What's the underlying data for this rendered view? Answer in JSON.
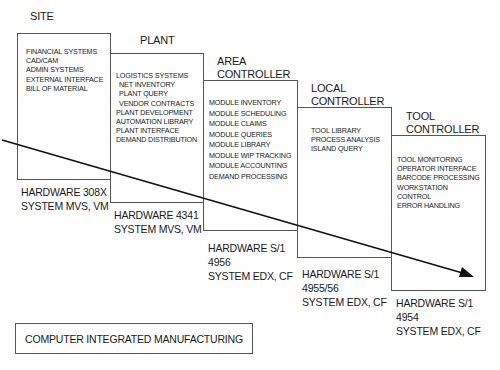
{
  "diagram": {
    "levels": [
      {
        "title": [
          "SITE"
        ],
        "items": [
          "FINANCIAL SYSTEMS",
          "CAD/CAM",
          "ADMIN SYSTEMS",
          "EXTERNAL INTERFACE",
          "BILL OF MATERIAL"
        ],
        "hardware": [
          "HARDWARE 308X",
          "SYSTEM MVS, VM"
        ]
      },
      {
        "title": [
          "PLANT"
        ],
        "items": [
          "LOGISTICS SYSTEMS",
          " NET INVENTORY",
          " PLANT QUERY",
          " VENDOR CONTRACTS",
          "PLANT DEVELOPMENT",
          "AUTOMATION LIBRARY",
          "PLANT INTERFACE",
          "DEMAND DISTRIBUTION"
        ],
        "hardware": [
          "HARDWARE 4341",
          "SYSTEM MVS, VM"
        ]
      },
      {
        "title": [
          "AREA",
          "CONTROLLER"
        ],
        "items": [
          "MODULE INVENTORY",
          "MODULE SCHEDULING",
          "MODULE CLAIMS",
          "MODULE QUERIES",
          "MODULE LIBRARY",
          "MODULE WIP TRACKING",
          "MODULE ACCOUNTING",
          "DEMAND PROCESSING"
        ],
        "hardware": [
          "HARDWARE S/1",
          "4956",
          "SYSTEM EDX, CF"
        ]
      },
      {
        "title": [
          "LOCAL",
          "CONTROLLER"
        ],
        "items": [
          "TOOL LIBRARY",
          "PROCESS ANALYSIS",
          "ISLAND QUERY"
        ],
        "hardware": [
          "HARDWARE S/1",
          "4955/56",
          "SYSTEM EDX, CF"
        ]
      },
      {
        "title": [
          "TOOL",
          "CONTROLLER"
        ],
        "items": [
          "TOOL MONITORING",
          "OPERATOR INTERFACE",
          "BARCODE PROCESSING",
          "WORKSTATION",
          "CONTROL",
          "ERROR HANDLING"
        ],
        "hardware": [
          "HARDWARE S/1",
          "4954",
          "SYSTEM EDX, CF"
        ]
      }
    ],
    "legend": "COMPUTER INTEGRATED MANUFACTURING",
    "colors": {
      "line": "#111111",
      "border": "#555555"
    }
  }
}
